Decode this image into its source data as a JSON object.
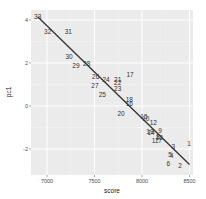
{
  "chart_data": {
    "type": "scatter",
    "title": "",
    "xlabel": "score",
    "ylabel": "pc1",
    "xlim": [
      6860,
      8540
    ],
    "ylim": [
      -3.2,
      4.4
    ],
    "x_ticks": [
      7000,
      7500,
      8000,
      8500
    ],
    "y_ticks": [
      4,
      2,
      0,
      -2
    ],
    "x_tick_labels": [
      "7000",
      "7500",
      "8000",
      "8500"
    ],
    "y_tick_labels": [
      "4",
      "2",
      "0",
      "-2"
    ],
    "grid": true,
    "legend": "none",
    "points": [
      {
        "label": "33",
        "x": 6902,
        "y": 4.15
      },
      {
        "label": "32",
        "x": 7007,
        "y": 3.43
      },
      {
        "label": "31",
        "x": 7224,
        "y": 3.43
      },
      {
        "label": "30",
        "x": 7232,
        "y": 2.29
      },
      {
        "label": "29",
        "x": 7305,
        "y": 1.86
      },
      {
        "label": "28",
        "x": 7418,
        "y": 1.94
      },
      {
        "label": "26",
        "x": 7512,
        "y": 1.36
      },
      {
        "label": "24",
        "x": 7621,
        "y": 1.21
      },
      {
        "label": "27",
        "x": 7505,
        "y": 0.93
      },
      {
        "label": "25",
        "x": 7582,
        "y": 0.5
      },
      {
        "label": "17",
        "x": 7874,
        "y": 1.47
      },
      {
        "label": "21",
        "x": 7744,
        "y": 1.2
      },
      {
        "label": "22",
        "x": 7744,
        "y": 1.08
      },
      {
        "label": "23",
        "x": 7744,
        "y": 0.82
      },
      {
        "label": "18",
        "x": 7866,
        "y": 0.28
      },
      {
        "label": "16",
        "x": 7866,
        "y": 0.09
      },
      {
        "label": "20",
        "x": 7779,
        "y": -0.34
      },
      {
        "label": "15",
        "x": 8020,
        "y": -0.52
      },
      {
        "label": "10",
        "x": 8040,
        "y": -0.6
      },
      {
        "label": "12",
        "x": 8119,
        "y": -0.78
      },
      {
        "label": "19",
        "x": 8084,
        "y": -1.2
      },
      {
        "label": "14",
        "x": 8095,
        "y": -1.26
      },
      {
        "label": "9",
        "x": 8189,
        "y": -1.16
      },
      {
        "label": "8",
        "x": 8170,
        "y": -1.42
      },
      {
        "label": "13",
        "x": 8182,
        "y": -1.48
      },
      {
        "label": "11",
        "x": 8137,
        "y": -1.61
      },
      {
        "label": "7",
        "x": 8190,
        "y": -1.6
      },
      {
        "label": "3",
        "x": 8330,
        "y": -1.89
      },
      {
        "label": "1",
        "x": 8495,
        "y": -1.77
      },
      {
        "label": "5",
        "x": 8295,
        "y": -2.27
      },
      {
        "label": "4",
        "x": 8310,
        "y": -2.32
      },
      {
        "label": "6",
        "x": 8277,
        "y": -2.7
      },
      {
        "label": "2",
        "x": 8400,
        "y": -2.79
      }
    ],
    "regression_line": {
      "x": [
        6902,
        8500
      ],
      "y": [
        4.15,
        -2.72
      ],
      "color": "#333333"
    }
  },
  "colors": {
    "panel_bg": "#ebebeb",
    "grid_major": "#ffffff",
    "text": "#333333"
  }
}
